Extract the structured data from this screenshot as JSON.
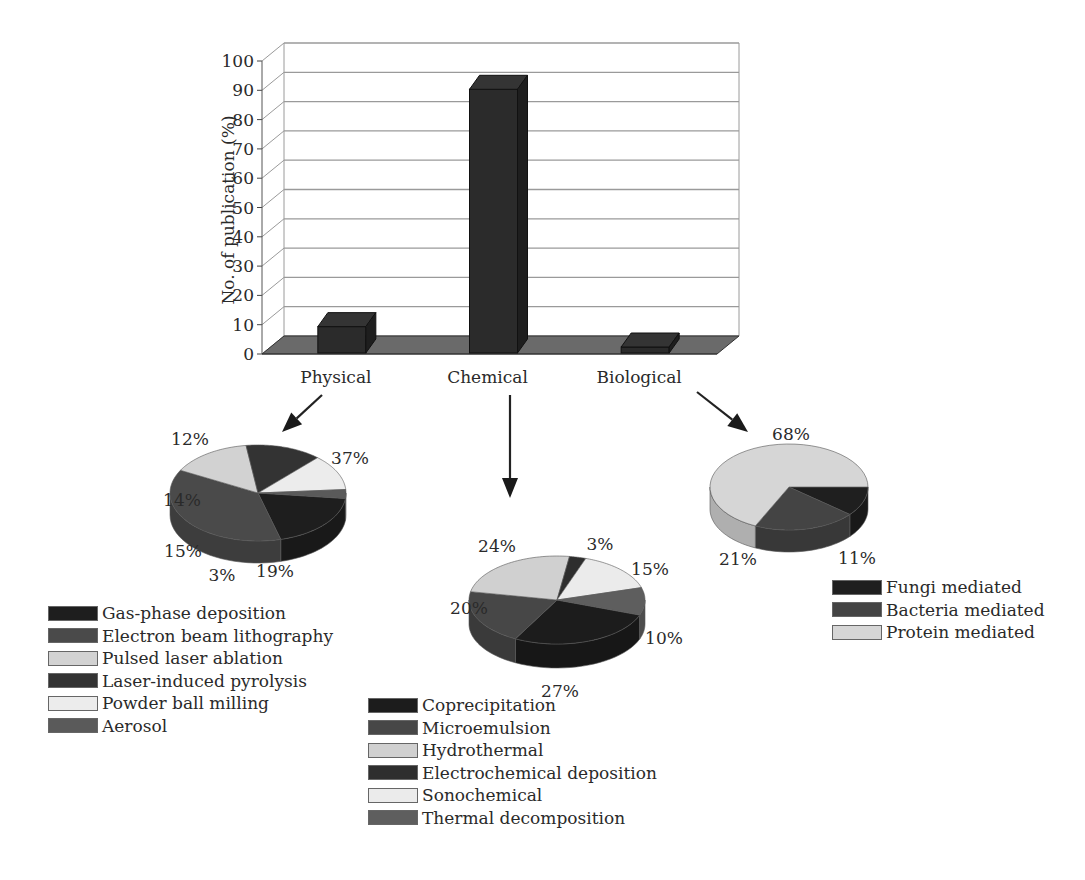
{
  "chart_data": [
    {
      "type": "bar",
      "title": "",
      "xlabel": "",
      "ylabel": "No. of publication (%)",
      "categories": [
        "Physical",
        "Chemical",
        "Biological"
      ],
      "values": [
        9,
        90,
        2
      ],
      "ylim": [
        0,
        100
      ],
      "yticks": [
        0,
        10,
        20,
        30,
        40,
        50,
        60,
        70,
        80,
        90,
        100
      ],
      "grid": true,
      "style": "3d"
    },
    {
      "type": "pie",
      "title": "Physical",
      "labels": [
        "Gas-phase deposition",
        "Electron beam lithography",
        "Pulsed laser ablation",
        "Laser-induced pyrolysis",
        "Powder ball milling",
        "Aerosol"
      ],
      "values": [
        19,
        37,
        15,
        14,
        12,
        3
      ],
      "value_labels": [
        "19%",
        "37%",
        "15%",
        "14%",
        "12%",
        "3%"
      ],
      "legend_position": "below"
    },
    {
      "type": "pie",
      "title": "Chemical",
      "labels": [
        "Coprecipitation",
        "Microemulsion",
        "Hydrothermal",
        "Electrochemical deposition",
        "Sonochemical",
        "Thermal decomposition"
      ],
      "values": [
        27,
        20,
        24,
        3,
        15,
        10
      ],
      "value_labels": [
        "27%",
        "20%",
        "24%",
        "3%",
        "15%",
        "10%"
      ],
      "legend_position": "below"
    },
    {
      "type": "pie",
      "title": "Biological",
      "labels": [
        "Fungi mediated",
        "Bacteria mediated",
        "Protein mediated"
      ],
      "values": [
        11,
        21,
        68
      ],
      "value_labels": [
        "11%",
        "21%",
        "68%"
      ],
      "legend_position": "below-right"
    }
  ],
  "colors": {
    "bar": "#2b2b2b",
    "floor": "#6a6a6a",
    "grid": "#9a9a9a",
    "physical": [
      "#1e1e1e",
      "#4a4a4a",
      "#d2d2d2",
      "#333333",
      "#ececec",
      "#5a5a5a"
    ],
    "chemical": [
      "#1c1c1c",
      "#474747",
      "#d0d0d0",
      "#2e2e2e",
      "#ebebeb",
      "#5e5e5e"
    ],
    "biological": [
      "#1f1f1f",
      "#444444",
      "#d6d6d6"
    ]
  }
}
